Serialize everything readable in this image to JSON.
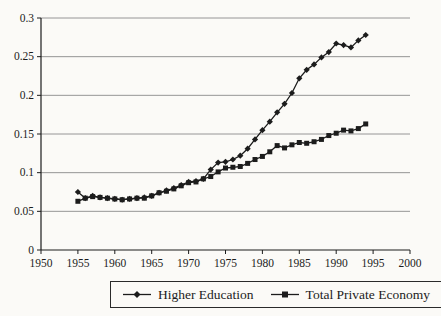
{
  "chart_data": {
    "type": "line",
    "x": [
      1955,
      1956,
      1957,
      1958,
      1959,
      1960,
      1961,
      1962,
      1963,
      1964,
      1965,
      1966,
      1967,
      1968,
      1969,
      1970,
      1971,
      1972,
      1973,
      1974,
      1975,
      1976,
      1977,
      1978,
      1979,
      1980,
      1981,
      1982,
      1983,
      1984,
      1985,
      1986,
      1987,
      1988,
      1989,
      1990,
      1991,
      1992,
      1993,
      1994
    ],
    "series": [
      {
        "name": "Higher Education",
        "marker": "diamond",
        "color": "#1c1c1c",
        "values": [
          0.075,
          0.067,
          0.07,
          0.068,
          0.067,
          0.066,
          0.065,
          0.066,
          0.067,
          0.068,
          0.07,
          0.074,
          0.077,
          0.08,
          0.084,
          0.088,
          0.089,
          0.092,
          0.104,
          0.113,
          0.114,
          0.117,
          0.122,
          0.131,
          0.143,
          0.155,
          0.166,
          0.178,
          0.189,
          0.203,
          0.222,
          0.233,
          0.24,
          0.249,
          0.256,
          0.267,
          0.265,
          0.262,
          0.271,
          0.278
        ]
      },
      {
        "name": "Total Private Economy",
        "marker": "square",
        "color": "#1c1c1c",
        "values": [
          0.063,
          0.067,
          0.069,
          0.068,
          0.067,
          0.066,
          0.065,
          0.066,
          0.067,
          0.067,
          0.07,
          0.074,
          0.076,
          0.079,
          0.083,
          0.087,
          0.088,
          0.092,
          0.095,
          0.101,
          0.106,
          0.107,
          0.108,
          0.112,
          0.117,
          0.121,
          0.127,
          0.135,
          0.132,
          0.136,
          0.139,
          0.138,
          0.14,
          0.143,
          0.148,
          0.151,
          0.155,
          0.154,
          0.157,
          0.163
        ]
      }
    ],
    "xlabel": "",
    "ylabel": "",
    "xlim": [
      1950,
      2000
    ],
    "ylim": [
      0,
      0.3
    ],
    "xticks": [
      1950,
      1955,
      1960,
      1965,
      1970,
      1975,
      1980,
      1985,
      1990,
      1995,
      2000
    ],
    "xtick_labels": [
      "1950",
      "1955",
      "1960",
      "1965",
      "1970",
      "1975",
      "1980",
      "1985",
      "1990",
      "1995",
      "2000"
    ],
    "yticks": [
      0,
      0.05,
      0.1,
      0.15,
      0.2,
      0.25,
      0.3
    ],
    "ytick_labels": [
      "0",
      "0.05",
      "0.1",
      "0.15",
      "0.2",
      "0.25",
      "0.3"
    ],
    "grid": "horizontal",
    "legend_position": "bottom-center"
  },
  "legend": {
    "items": [
      {
        "label": "Higher Education",
        "marker": "diamond"
      },
      {
        "label": "Total Private Economy",
        "marker": "square"
      }
    ]
  },
  "colors": {
    "line": "#1c1c1c",
    "grid": "#8a8a8a",
    "axis": "#1c1c1c",
    "text": "#1c1c1c",
    "background": "#fbfaf7"
  }
}
